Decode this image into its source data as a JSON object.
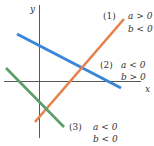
{
  "axes": {
    "x_label": "x",
    "y_label": "y",
    "color": "#444444"
  },
  "lines": [
    {
      "id": "1",
      "label": "(1)",
      "cond_a": "a > 0",
      "cond_b": "b < 0",
      "color": "#e8804a",
      "slope_sign": "positive",
      "intercept_sign": "negative"
    },
    {
      "id": "2",
      "label": "(2)",
      "cond_a": "a < 0",
      "cond_b": "b > 0",
      "color": "#3a86d8",
      "slope_sign": "negative",
      "intercept_sign": "positive"
    },
    {
      "id": "3",
      "label": "(3)",
      "cond_a": "a < 0",
      "cond_b": "b < 0",
      "color": "#5a9e6a",
      "slope_sign": "negative",
      "intercept_sign": "negative"
    }
  ]
}
